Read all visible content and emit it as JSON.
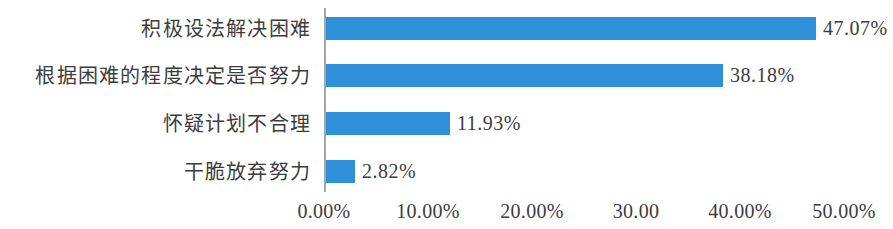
{
  "chart_data": {
    "type": "bar",
    "orientation": "horizontal",
    "title": "",
    "subtitle": "",
    "xlabel": "",
    "ylabel": "",
    "grid": false,
    "legend": false,
    "xlim": [
      0,
      50
    ],
    "categories": [
      "积极设法解决困难",
      "根据困难的程度决定是否努力",
      "怀疑计划不合理",
      "干脆放弃努力"
    ],
    "values": [
      47.07,
      38.18,
      11.93,
      2.82
    ],
    "value_labels": [
      "47.07%",
      "38.18%",
      "11.93%",
      "2.82%"
    ],
    "xticks": [
      0,
      10,
      20,
      30,
      40,
      50
    ],
    "xtick_labels": [
      "0.00%",
      "10.00%",
      "20.00%",
      "30.00",
      "40.00%",
      "50.00%"
    ],
    "series": [
      {
        "name": "",
        "values": [
          47.07,
          38.18,
          11.93,
          2.82
        ],
        "color": "#2f90da"
      }
    ],
    "colors": {
      "bar": "#2f90da",
      "axis": "#a6a6a6",
      "text": "#3d3d3d",
      "background": "#ffffff"
    }
  }
}
